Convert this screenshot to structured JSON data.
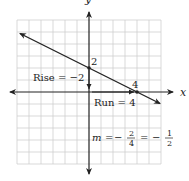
{
  "diagram": {
    "type": "coordinate-plane-slope",
    "axes": {
      "x_label": "x",
      "y_label": "y",
      "grid_range": [
        -6,
        6
      ],
      "unit_px": 12
    },
    "line": {
      "slope": "-1/2",
      "y_intercept": 2,
      "x_intercept": 4,
      "points": [
        [
          0,
          2
        ],
        [
          4,
          0
        ]
      ]
    },
    "labels": {
      "y_intercept": "2",
      "x_intercept": "4",
      "rise": "Rise = −2",
      "run": "Run = 4",
      "slope_m": "m",
      "slope_eq": "=",
      "slope_neg": "−",
      "frac1_num": "2",
      "frac1_den": "4",
      "frac2_num": "1",
      "frac2_den": "2"
    },
    "colors": {
      "grid": "#c8c8c8",
      "axis": "#222222",
      "line": "#222222"
    }
  }
}
